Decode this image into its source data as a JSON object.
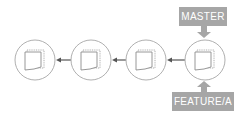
{
  "diagram": {
    "commits": [
      {
        "id": "commit-1"
      },
      {
        "id": "commit-2"
      },
      {
        "id": "commit-3"
      },
      {
        "id": "commit-4"
      }
    ],
    "labels": {
      "master": "MASTER",
      "feature": "FEATURE/A"
    },
    "colors": {
      "label_bg": "#a6a6a6",
      "label_text": "#ffffff",
      "circle_stroke": "#b0b0b0",
      "arrow": "#555555",
      "doc_stroke": "#8c8c8c"
    }
  }
}
